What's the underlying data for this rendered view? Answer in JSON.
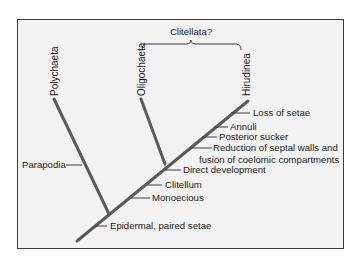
{
  "diagram": {
    "type": "cladogram",
    "group_label": "Clitellata?",
    "taxa": [
      {
        "name": "Polychaeta"
      },
      {
        "name": "Oligochaeta"
      },
      {
        "name": "Hirudinea"
      }
    ],
    "polychaeta_characters": [
      "Parapodia"
    ],
    "trunk_characters": [
      "Epidermal, paired setae",
      "Monoecious",
      "Clitellum",
      "Direct development"
    ],
    "hirudinea_characters": {
      "reduction_line1": "Reduction of septal walls and",
      "reduction_line2": "fusion of coelomic compartments",
      "posterior_sucker": "Posterior sucker",
      "annuli": "Annuli",
      "loss_of_setae": "Loss of setae"
    },
    "colors": {
      "frame_bg": "#f2f2f2",
      "branch": "#5a5a5a",
      "text": "#1a1a1a"
    }
  }
}
